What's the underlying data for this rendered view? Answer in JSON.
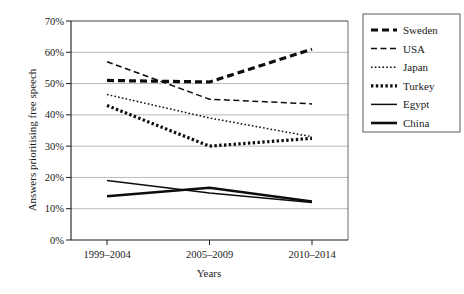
{
  "chart_data": {
    "type": "line",
    "title": "",
    "xlabel": "Years",
    "ylabel": "Answers prioritising free speech",
    "categories": [
      "1999–2004",
      "2005–2009",
      "2010–2014"
    ],
    "ylim": [
      0,
      70
    ],
    "ytick_labels": [
      "0%",
      "10%",
      "20%",
      "30%",
      "40%",
      "50%",
      "60%",
      "70%"
    ],
    "ytick_values": [
      0,
      10,
      20,
      30,
      40,
      50,
      60,
      70
    ],
    "grid": true,
    "legend_position": "right-outside",
    "value_suffix": "%",
    "series": [
      {
        "name": "Sweden",
        "values": [
          51,
          50.5,
          61
        ],
        "line_style": "thick-dash",
        "dasharray": "7,4",
        "width": 3.2,
        "color": "#0d0d0d"
      },
      {
        "name": "USA",
        "values": [
          57,
          45,
          43.5
        ],
        "line_style": "thin-dash",
        "dasharray": "6,3.5",
        "width": 1.5,
        "color": "#0d0d0d"
      },
      {
        "name": "Japan",
        "values": [
          46.5,
          39,
          33
        ],
        "line_style": "fine-dot",
        "dasharray": "1.6,2.2",
        "width": 1.5,
        "color": "#0d0d0d"
      },
      {
        "name": "Turkey",
        "values": [
          43,
          30,
          32.5
        ],
        "line_style": "thick-dot",
        "dasharray": "2.4,2.4",
        "width": 3.2,
        "color": "#0d0d0d"
      },
      {
        "name": "Egypt",
        "values": [
          19,
          15,
          12
        ],
        "line_style": "thin-solid",
        "dasharray": "none",
        "width": 1.5,
        "color": "#0d0d0d"
      },
      {
        "name": "China",
        "values": [
          14,
          16.7,
          12.3
        ],
        "line_style": "thick-solid",
        "dasharray": "none",
        "width": 2.6,
        "color": "#0d0d0d"
      }
    ]
  }
}
